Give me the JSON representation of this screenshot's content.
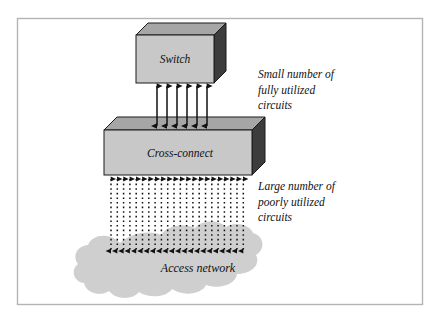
{
  "figure": {
    "type": "network-diagram",
    "background_color": "#ffffff",
    "frame": {
      "border_color": "#b4b4b4",
      "x": 17,
      "y": 18,
      "width": 406,
      "height": 287
    },
    "nodes": [
      {
        "id": "switch",
        "label": "Switch",
        "shape": "3d-box",
        "front_color": "#c8c8c8",
        "top_color": "#a6a6a6",
        "side_color": "#3c3c3c",
        "outline_color": "#1a1a1a",
        "x": 136,
        "y": 35,
        "width": 78,
        "height": 48,
        "depth": 12
      },
      {
        "id": "cross-connect",
        "label": "Cross-connect",
        "shape": "3d-box",
        "front_color": "#c8c8c8",
        "top_color": "#a6a6a6",
        "side_color": "#3c3c3c",
        "outline_color": "#1a1a1a",
        "x": 104,
        "y": 130,
        "width": 148,
        "height": 45,
        "depth": 13
      },
      {
        "id": "access-network",
        "label": "Access network",
        "shape": "cloud",
        "fill_color": "#cfcfcf",
        "x": 92,
        "y": 232,
        "width": 212,
        "height": 66
      }
    ],
    "links": [
      {
        "id": "switch-to-cross-connect",
        "style": "solid",
        "arrowheads": "double",
        "count": 6,
        "color": "#111111",
        "from_node": "switch",
        "to_node": "cross-connect",
        "x_start": 157,
        "x_spacing": 10,
        "y_top": 84,
        "y_bottom": 128
      },
      {
        "id": "cross-connect-to-access-network",
        "style": "dotted",
        "arrowheads": "double",
        "count": 22,
        "color": "#111111",
        "from_node": "cross-connect",
        "to_node": "access-network",
        "x_start": 111,
        "x_spacing": 6.3,
        "y_top": 177,
        "y_bottom": 253
      }
    ],
    "annotations": [
      {
        "id": "annotation-upper",
        "lines": [
          "Small number of",
          "fully utilized",
          "circuits"
        ],
        "x": 258,
        "y": 78,
        "line_height": 15.5,
        "describes": "switch-to-cross-connect"
      },
      {
        "id": "annotation-lower",
        "lines": [
          "Large number of",
          "poorly utilized",
          "circuits"
        ],
        "x": 258,
        "y": 190,
        "line_height": 15.5,
        "describes": "cross-connect-to-access-network"
      }
    ]
  }
}
